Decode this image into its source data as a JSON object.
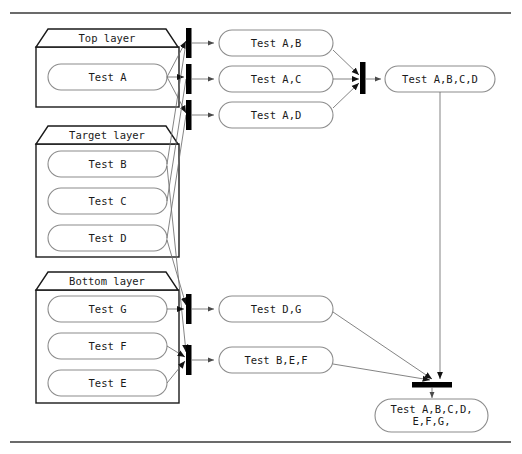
{
  "diagram": {
    "top_rule": true,
    "bottom_rule": true,
    "layers": [
      {
        "id": "top-layer",
        "title": "Top layer",
        "items": [
          {
            "id": "test-a",
            "label": "Test A"
          }
        ]
      },
      {
        "id": "target-layer",
        "title": "Target layer",
        "items": [
          {
            "id": "test-b",
            "label": "Test B"
          },
          {
            "id": "test-c",
            "label": "Test C"
          },
          {
            "id": "test-d",
            "label": "Test D"
          }
        ]
      },
      {
        "id": "bottom-layer",
        "title": "Bottom layer",
        "items": [
          {
            "id": "test-g",
            "label": "Test G"
          },
          {
            "id": "test-f",
            "label": "Test F"
          },
          {
            "id": "test-e",
            "label": "Test E"
          }
        ]
      }
    ],
    "combination_nodes": [
      {
        "id": "test-ab",
        "label": "Test A,B"
      },
      {
        "id": "test-ac",
        "label": "Test A,C"
      },
      {
        "id": "test-ad",
        "label": "Test A,D"
      },
      {
        "id": "test-dg",
        "label": "Test D,G"
      },
      {
        "id": "test-bef",
        "label": "Test B,E,F"
      }
    ],
    "merge_nodes": [
      {
        "id": "test-abcd",
        "label": "Test A,B,C,D"
      },
      {
        "id": "test-abcdefg",
        "label_line_1": "Test A,B,C,D,",
        "label_line_2": "E,F,G,"
      }
    ],
    "sync_bars": [
      {
        "id": "fork-bar-1",
        "orientation": "vertical"
      },
      {
        "id": "fork-bar-2",
        "orientation": "vertical"
      },
      {
        "id": "fork-bar-3",
        "orientation": "vertical"
      },
      {
        "id": "fork-bar-4",
        "orientation": "vertical"
      },
      {
        "id": "fork-bar-5",
        "orientation": "vertical"
      },
      {
        "id": "join-bar-upper",
        "orientation": "vertical"
      },
      {
        "id": "join-bar-lower",
        "orientation": "horizontal"
      }
    ],
    "colors": {
      "background": "#ffffff",
      "rule": "#3a3a3a",
      "layer_border": "#1a1a1a",
      "node_border": "#8c8c8c",
      "edge": "#6e6e6e",
      "bar": "#000000",
      "text": "#1a1a1a"
    }
  }
}
